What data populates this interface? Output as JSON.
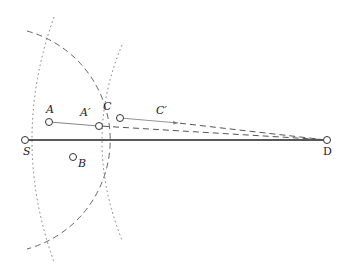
{
  "diagram": {
    "type": "geometric-routing-diagram",
    "nodes": [
      {
        "id": "S",
        "label": "S",
        "x": 25,
        "y": 140
      },
      {
        "id": "D",
        "label": "D",
        "x": 327,
        "y": 140
      },
      {
        "id": "A",
        "label": "A",
        "x": 49,
        "y": 122
      },
      {
        "id": "A_prime",
        "label": "A′",
        "x": 99,
        "y": 126
      },
      {
        "id": "C",
        "label": "C",
        "x": 120,
        "y": 118
      },
      {
        "id": "B",
        "label": "B",
        "x": 73,
        "y": 157
      }
    ],
    "edge_labels": [
      {
        "id": "C_prime",
        "label": "C′",
        "x": 162,
        "y": 117
      }
    ],
    "edges": [
      {
        "from": "S",
        "to": "D",
        "style": "solid-thick"
      },
      {
        "from": "A",
        "to": "A_prime",
        "style": "solid-thin"
      },
      {
        "from": "A_prime",
        "to": "D",
        "style": "dashed"
      },
      {
        "from": "C",
        "to": "C_prime",
        "style": "solid-thin-arrow"
      },
      {
        "from": "C_prime",
        "to": "D",
        "style": "dashed"
      }
    ],
    "arcs": [
      {
        "name": "range-arc-S",
        "style": "dashed",
        "center": "S",
        "radius": 113
      },
      {
        "name": "dotted-arc-outer",
        "style": "dotted"
      },
      {
        "name": "dotted-arc-inner",
        "style": "dotted"
      }
    ],
    "colors": {
      "line": "#222222",
      "dashed": "#555555",
      "dotted": "#777777"
    }
  }
}
